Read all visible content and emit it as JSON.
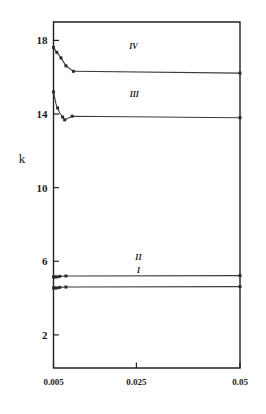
{
  "chart_data": {
    "type": "line",
    "title": "",
    "subtitle": "",
    "xlabel": "",
    "ylabel": "k",
    "xlim": [
      0.005,
      0.05
    ],
    "ylim": [
      0.2,
      19.0
    ],
    "xticks": [
      0.005,
      0.025,
      0.05
    ],
    "xtick_labels": [
      "0.005",
      "0.025",
      "0.05"
    ],
    "yticks": [
      2,
      6,
      10,
      14,
      18
    ],
    "ytick_labels": [
      "2",
      "6",
      "10",
      "14",
      "18"
    ],
    "grid": false,
    "legend": "inline-curve-labels",
    "frame": "box",
    "series": [
      {
        "name": "I",
        "label": "I",
        "label_x": 0.0255,
        "label_y": 5.35,
        "x": [
          0.005,
          0.0053,
          0.0058,
          0.0065,
          0.008,
          0.0095,
          0.05
        ],
        "y": [
          4.55,
          4.55,
          4.55,
          4.58,
          4.6,
          4.6,
          4.62
        ],
        "markers": [
          0.005,
          0.0053,
          0.0058,
          0.0065,
          0.008,
          0.05
        ]
      },
      {
        "name": "II",
        "label": "II",
        "label_x": 0.0255,
        "label_y": 6.05,
        "x": [
          0.005,
          0.0053,
          0.0058,
          0.0065,
          0.008,
          0.0095,
          0.05
        ],
        "y": [
          5.15,
          5.15,
          5.15,
          5.18,
          5.2,
          5.2,
          5.22
        ],
        "markers": [
          0.005,
          0.0053,
          0.0058,
          0.0065,
          0.008,
          0.05
        ]
      },
      {
        "name": "III",
        "label": "III",
        "label_x": 0.0245,
        "label_y": 14.95,
        "x": [
          0.005,
          0.0056,
          0.0065,
          0.0077,
          0.0095,
          0.05
        ],
        "y": [
          15.2,
          14.55,
          14.05,
          13.68,
          13.88,
          13.8
        ],
        "markers": [
          0.005,
          0.006,
          0.0072,
          0.0077,
          0.0095,
          0.05
        ]
      },
      {
        "name": "IV",
        "label": "IV",
        "label_x": 0.0243,
        "label_y": 17.55,
        "x": [
          0.005,
          0.0058,
          0.0068,
          0.008,
          0.0098,
          0.05
        ],
        "y": [
          17.62,
          17.35,
          17.05,
          16.62,
          16.32,
          16.22
        ],
        "markers": [
          0.005,
          0.0058,
          0.0068,
          0.008,
          0.0098,
          0.05
        ]
      }
    ]
  },
  "axes": {
    "y_axis_title": "k"
  }
}
